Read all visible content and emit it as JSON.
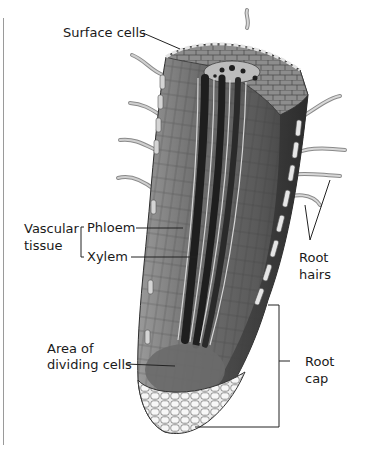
{
  "figure": {
    "labels": {
      "surface_cells": "Surface cells",
      "vascular_line1": "Vascular",
      "vascular_line2": "tissue",
      "phloem": "Phloem",
      "xylem": "Xylem",
      "root_hairs_line1": "Root",
      "root_hairs_line2": "hairs",
      "dividing_line1": "Area of",
      "dividing_line2": "dividing cells",
      "root_cap_line1": "Root",
      "root_cap_line2": "cap"
    },
    "colors": {
      "background": "#ffffff",
      "leader_line": "#222222",
      "root_dark": "#3c3c3c",
      "root_mid": "#7a7a7a",
      "root_light": "#bdbdbd",
      "cap_cells": "#e8e8e8",
      "margin_rule": "#9a9a9a"
    }
  }
}
